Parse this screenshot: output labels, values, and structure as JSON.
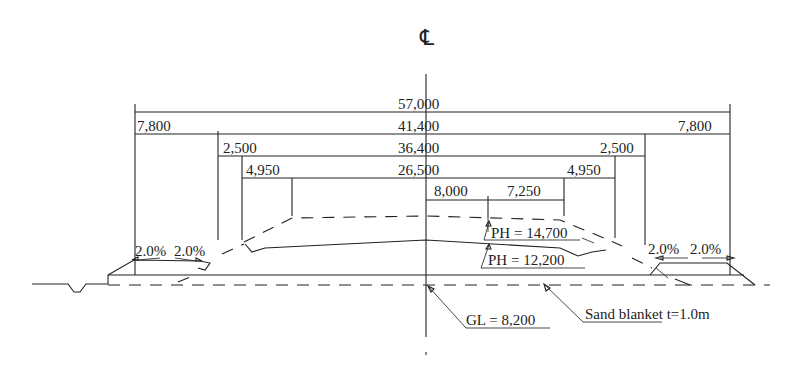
{
  "diagram": {
    "centerline_symbol": "℄",
    "dimensions": {
      "total_width": "57,000",
      "outer_left": "7,800",
      "outer_right": "7,800",
      "inner_width": "41,400",
      "shoulder_left": "2,500",
      "shoulder_right": "2,500",
      "carriage_width": "36,400",
      "lane_left": "4,950",
      "lane_right": "4,950",
      "pavement_width": "26,500",
      "offset_a": "8,000",
      "offset_b": "7,250"
    },
    "slopes": {
      "left_1": "2.0%",
      "left_2": "2.0%",
      "right_1": "2.0%",
      "right_2": "2.0%"
    },
    "annotations": {
      "ph_upper": "PH = 14,700",
      "ph_lower": "PH = 12,200",
      "ground_level": "GL = 8,200",
      "sand_blanket": "Sand blanket t=1.0m"
    }
  }
}
